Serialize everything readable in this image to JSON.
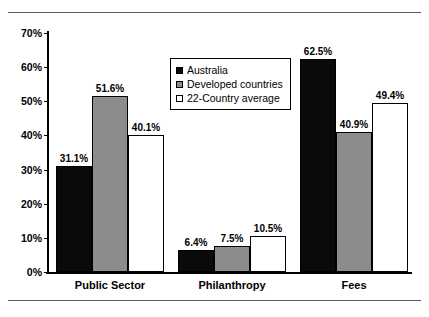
{
  "chart_data": {
    "type": "bar",
    "title": "",
    "xlabel": "",
    "ylabel": "",
    "categories": [
      "Public Sector",
      "Philanthropy",
      "Fees"
    ],
    "series": [
      {
        "name": "Australia",
        "color": "#0a0a0a",
        "values": [
          31.1,
          6.4,
          62.5
        ],
        "labels": [
          "31.1%",
          "6.4%",
          "62.5%"
        ]
      },
      {
        "name": "Developed countries",
        "color": "#8c8c8c",
        "values": [
          51.6,
          7.5,
          40.9
        ],
        "labels": [
          "51.6%",
          "7.5%",
          "40.9%"
        ]
      },
      {
        "name": "22-Country average",
        "color": "#ffffff",
        "values": [
          40.1,
          10.5,
          49.4
        ],
        "labels": [
          "40.1%",
          "10.5%",
          "49.4%"
        ]
      }
    ],
    "ylim": [
      0,
      70
    ],
    "ytick_values": [
      0,
      10,
      20,
      30,
      40,
      50,
      60,
      70
    ],
    "ytick_labels": [
      "0%",
      "10%",
      "20%",
      "30%",
      "40%",
      "50%",
      "60%",
      "70%"
    ],
    "grid": false,
    "legend_position": "upper-center",
    "legend_entries": [
      "Australia",
      "Developed countries",
      "22-Country average"
    ]
  }
}
